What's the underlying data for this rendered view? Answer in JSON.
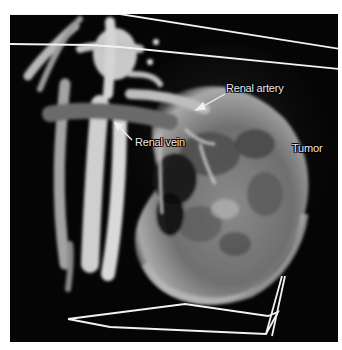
{
  "figure": {
    "type": "3D volume-rendered CT angiography",
    "background_color": "#050505",
    "frame_border_color": "#ffffff"
  },
  "annotations": [
    {
      "id": "renal-artery",
      "text": "Renal artery",
      "has_arrow": true
    },
    {
      "id": "renal-vein",
      "text": "Renal vein",
      "has_arrow": true
    },
    {
      "id": "tumor",
      "text": "Tumor",
      "has_arrow": false
    }
  ]
}
